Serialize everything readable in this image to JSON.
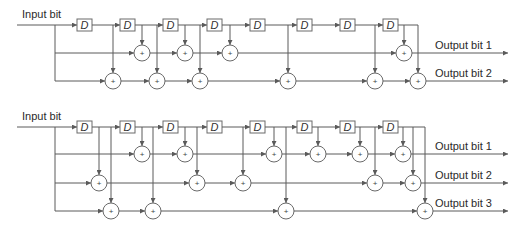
{
  "colors": {
    "wire": "#5a5a5a",
    "box_stroke": "#6a6a6a",
    "text": "#2a2a2a",
    "background": "#ffffff"
  },
  "diagrams": [
    {
      "id": "encoder-rate-1-2",
      "input_label": "Input bit",
      "delay_label": "D",
      "num_delays": 8,
      "outputs": [
        {
          "label": "Output bit 1",
          "taps": [
            0,
            2,
            3,
            4,
            8
          ]
        },
        {
          "label": "Output bit 2",
          "taps": [
            0,
            1,
            2,
            3,
            5,
            7,
            8
          ]
        }
      ]
    },
    {
      "id": "encoder-rate-1-3",
      "input_label": "Input bit",
      "delay_label": "D",
      "num_delays": 8,
      "outputs": [
        {
          "label": "Output bit 1",
          "taps": [
            0,
            2,
            3,
            5,
            6,
            7,
            8
          ]
        },
        {
          "label": "Output bit 2",
          "taps": [
            0,
            1,
            3,
            4,
            7,
            8
          ]
        },
        {
          "label": "Output bit 3",
          "taps": [
            0,
            1,
            2,
            5,
            8
          ]
        }
      ]
    }
  ],
  "labels": {
    "d1": "Input bit",
    "d1_out1": "Output bit 1",
    "d1_out2": "Output bit 2",
    "d2": "Input bit",
    "d2_out1": "Output bit 1",
    "d2_out2": "Output bit 2",
    "d2_out3": "Output bit 3",
    "delay": "D",
    "plus": "+"
  }
}
